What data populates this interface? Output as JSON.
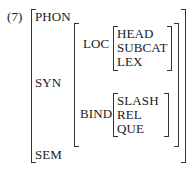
{
  "example_number": "(7)",
  "avm": {
    "features": [
      {
        "label": "PHON"
      },
      {
        "label": "SYN",
        "value": {
          "features": [
            {
              "label": "LOC",
              "value": {
                "features": [
                  "HEAD",
                  "SUBCAT",
                  "LEX"
                ]
              }
            },
            {
              "label": "BIND",
              "value": {
                "features": [
                  "SLASH",
                  "REL",
                  "QUE"
                ]
              }
            }
          ]
        }
      },
      {
        "label": "SEM"
      }
    ]
  }
}
